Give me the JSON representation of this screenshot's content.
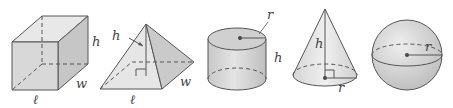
{
  "diagram": {
    "colors": {
      "stroke": "#555555",
      "face_light": "#e6e6e6",
      "face_mid": "#d4d4d4",
      "face_dark": "#c2c2c2",
      "label": "#444444"
    },
    "shapes": [
      {
        "name": "rectangular-prism",
        "labels": {
          "height": "h",
          "width": "w",
          "length": "ℓ"
        }
      },
      {
        "name": "pyramid",
        "labels": {
          "height": "h",
          "width": "w",
          "length": "ℓ"
        }
      },
      {
        "name": "cylinder",
        "labels": {
          "radius": "r",
          "height": "h"
        }
      },
      {
        "name": "cone",
        "labels": {
          "height": "h",
          "radius": "r"
        }
      },
      {
        "name": "sphere",
        "labels": {
          "radius": "r"
        }
      }
    ]
  }
}
